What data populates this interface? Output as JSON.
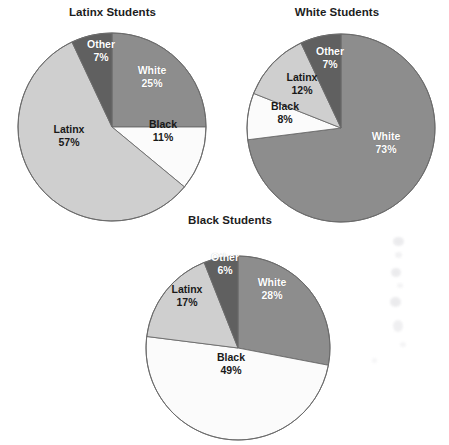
{
  "figure": {
    "background_color": "#ffffff",
    "width": 449,
    "height": 438
  },
  "palette": {
    "white_slice": "#8d8d8d",
    "black_slice": "#fbfbfb",
    "latinx_slice": "#cfcfcf",
    "other_slice": "#606060",
    "outline": "#6b6b6b",
    "title_color": "#1d1d1d",
    "dark_label_text": "#ffffff",
    "light_label_text": "#191919"
  },
  "charts": [
    {
      "id": "latinx-students",
      "title": "Latinx Students",
      "geometry": {
        "cx": 112,
        "cy": 127,
        "r": 92
      },
      "slices": [
        {
          "category": "White",
          "label": "White",
          "percent": 25,
          "percent_label": "25%",
          "color": "#8d8d8d",
          "label_tone": "dark",
          "label_x": 152,
          "label_y": 76
        },
        {
          "category": "Black",
          "label": "Black",
          "percent": 11,
          "percent_label": "11%",
          "color": "#fbfbfb",
          "label_tone": "light",
          "label_x": 163,
          "label_y": 130
        },
        {
          "category": "Latinx",
          "label": "Latinx",
          "percent": 57,
          "percent_label": "57%",
          "color": "#cfcfcf",
          "label_tone": "light",
          "label_x": 69,
          "label_y": 135
        },
        {
          "category": "Other",
          "label": "Other",
          "percent": 7,
          "percent_label": "7%",
          "color": "#606060",
          "label_tone": "dark",
          "label_x": 101,
          "label_y": 50
        }
      ]
    },
    {
      "id": "white-students",
      "title": "White Students",
      "geometry": {
        "cx": 341,
        "cy": 128,
        "r": 92
      },
      "slices": [
        {
          "category": "White",
          "label": "White",
          "percent": 73,
          "percent_label": "73%",
          "color": "#8d8d8d",
          "label_tone": "dark",
          "label_x": 386,
          "label_y": 142
        },
        {
          "category": "Black",
          "label": "Black",
          "percent": 8,
          "percent_label": "8%",
          "color": "#fbfbfb",
          "label_tone": "light",
          "label_x": 285,
          "label_y": 112
        },
        {
          "category": "Latinx",
          "label": "Latinx",
          "percent": 12,
          "percent_label": "12%",
          "color": "#cfcfcf",
          "label_tone": "light",
          "label_x": 302,
          "label_y": 83
        },
        {
          "category": "Other",
          "label": "Other",
          "percent": 7,
          "percent_label": "7%",
          "color": "#606060",
          "label_tone": "dark",
          "label_x": 330,
          "label_y": 57
        }
      ]
    },
    {
      "id": "black-students",
      "title": "Black Students",
      "geometry": {
        "cx": 230,
        "cy": 338,
        "r": 90
      },
      "slices": [
        {
          "category": "White",
          "label": "White",
          "percent": 28,
          "percent_label": "28%",
          "color": "#8d8d8d",
          "label_tone": "dark",
          "label_x": 272,
          "label_y": 288
        },
        {
          "category": "Black",
          "label": "Black",
          "percent": 49,
          "percent_label": "49%",
          "color": "#fbfbfb",
          "label_tone": "light",
          "label_x": 231,
          "label_y": 363
        },
        {
          "category": "Latinx",
          "label": "Latinx",
          "percent": 17,
          "percent_label": "17%",
          "color": "#cfcfcf",
          "label_tone": "light",
          "label_x": 187,
          "label_y": 295
        },
        {
          "category": "Other",
          "label": "Other",
          "percent": 6,
          "percent_label": "6%",
          "color": "#606060",
          "label_tone": "dark",
          "label_x": 225,
          "label_y": 263
        }
      ]
    }
  ],
  "chart_data": {
    "type": "pie",
    "panel_titles": [
      "Latinx Students",
      "White Students",
      "Black Students"
    ],
    "categories": [
      "White",
      "Black",
      "Latinx",
      "Other"
    ],
    "units": "percent",
    "start_angle_deg": 0,
    "direction": "clockwise",
    "legend": "none (slices labeled directly)",
    "series": [
      {
        "name": "Latinx Students",
        "values": [
          25,
          11,
          57,
          7
        ]
      },
      {
        "name": "White Students",
        "values": [
          73,
          8,
          12,
          7
        ]
      },
      {
        "name": "Black Students",
        "values": [
          28,
          49,
          17,
          6
        ]
      }
    ],
    "slice_colors": {
      "White": "#8d8d8d",
      "Black": "#fbfbfb",
      "Latinx": "#cfcfcf",
      "Other": "#606060"
    }
  }
}
